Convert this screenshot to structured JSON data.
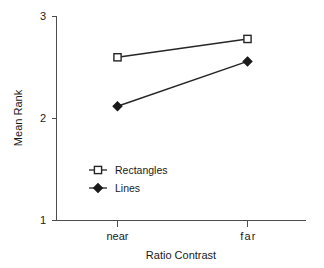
{
  "chart_data": {
    "type": "line",
    "title": "",
    "xlabel": "Ratio Contrast",
    "ylabel": "Mean Rank",
    "categories": [
      "near",
      "far"
    ],
    "xtick_labels": [
      "near",
      "far"
    ],
    "ytick_labels": [
      "1",
      "2",
      "3"
    ],
    "ytick_values": [
      1,
      2,
      3
    ],
    "ylim": [
      1,
      3
    ],
    "grid": false,
    "legend_position": "inside-lower-left",
    "series": [
      {
        "name": "Rectangles",
        "marker": "open-square",
        "values": [
          2.6,
          2.78
        ]
      },
      {
        "name": "Lines",
        "marker": "filled-diamond",
        "values": [
          2.12,
          2.56
        ]
      }
    ],
    "colors": {
      "line": "#262626",
      "axis": "#4d4d4d",
      "text": "#1a1a1a",
      "background": "#ffffff"
    }
  },
  "labels": {
    "y_axis_title": "Mean Rank",
    "x_axis_title": "Ratio Contrast",
    "ytick_top": "3",
    "ytick_mid": "2",
    "ytick_bottom": "1",
    "xtick_left": "near",
    "xtick_right": "far",
    "legend_rectangles": "Rectangles",
    "legend_lines": "Lines"
  }
}
